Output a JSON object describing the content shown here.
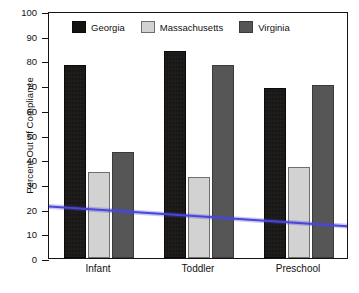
{
  "chart_data": {
    "type": "bar",
    "title": "",
    "subtitle": "",
    "xlabel": "",
    "ylabel": "Percent Out of Compliance",
    "categories": [
      "Infant",
      "Toddler",
      "Preschool"
    ],
    "series": [
      {
        "name": "Georgia",
        "color": "#151311",
        "values": [
          78,
          84,
          69
        ]
      },
      {
        "name": "Massachusetts",
        "color": "#d2d2d2",
        "values": [
          35,
          33,
          37
        ]
      },
      {
        "name": "Virginia",
        "color": "#565656",
        "values": [
          43,
          78,
          70
        ]
      }
    ],
    "ylim": [
      0,
      100
    ],
    "yticks": [
      0,
      10,
      20,
      30,
      40,
      50,
      60,
      70,
      80,
      90,
      100
    ],
    "ytick_labels": [
      "0",
      "10",
      "20",
      "30",
      "40",
      "50",
      "60",
      "70",
      "80",
      "90",
      "100"
    ],
    "grid": false,
    "legend_position": "top-inside",
    "annotations": [
      {
        "name": "trend-line",
        "type": "line",
        "color": "#4a46d8",
        "description": "blue downward trend line across all groups",
        "points": [
          {
            "x": "Infant",
            "y": 21
          },
          {
            "x": "Toddler",
            "y": 17
          },
          {
            "x": "Preschool",
            "y": 13
          }
        ]
      }
    ]
  },
  "legend": {
    "items": [
      {
        "label": "Georgia",
        "swatch": "legend-swatch-georgia"
      },
      {
        "label": "Massachusetts",
        "swatch": "legend-swatch-massachusetts"
      },
      {
        "label": "Virginia",
        "swatch": "legend-swatch-virginia"
      }
    ]
  },
  "axes": {
    "y_title": "Percent Out of Compliance",
    "y_ticks": [
      "100",
      "90",
      "80",
      "70",
      "60",
      "50",
      "40",
      "30",
      "20",
      "10",
      "0"
    ],
    "x_ticks": [
      "Infant",
      "Toddler",
      "Preschool"
    ]
  }
}
